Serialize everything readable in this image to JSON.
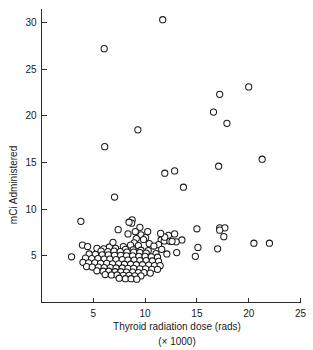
{
  "chart_data": {
    "type": "scatter",
    "title": "",
    "xlabel": "Thyroid radiation dose (rads)",
    "xlabel_sub": "(× 1000)",
    "ylabel": "mCi Administered",
    "xlim": [
      0,
      25
    ],
    "ylim": [
      0,
      31.5
    ],
    "xticks": [
      5,
      10,
      15,
      20,
      25
    ],
    "yticks": [
      5,
      10,
      15,
      20,
      25,
      30
    ],
    "xtick_labels": [
      "5",
      "10",
      "15",
      "20",
      "25"
    ],
    "ytick_labels": [
      "5",
      "10",
      "15",
      "20",
      "25",
      "30"
    ],
    "grid": false,
    "legend": null,
    "marker": "open-circle",
    "marker_color": "#1a1a1a",
    "marker_face": "#ffffff",
    "points": [
      [
        11.7,
        30.3
      ],
      [
        6.05,
        27.2
      ],
      [
        20.0,
        23.1
      ],
      [
        17.2,
        22.3
      ],
      [
        16.6,
        20.4
      ],
      [
        17.9,
        19.2
      ],
      [
        9.3,
        18.5
      ],
      [
        6.1,
        16.7
      ],
      [
        21.3,
        15.35
      ],
      [
        17.1,
        14.6
      ],
      [
        12.85,
        14.1
      ],
      [
        11.9,
        13.85
      ],
      [
        13.7,
        12.35
      ],
      [
        7.05,
        11.3
      ],
      [
        3.8,
        8.7
      ],
      [
        8.75,
        8.85
      ],
      [
        8.7,
        8.5
      ],
      [
        15.0,
        7.9
      ],
      [
        17.2,
        8.0
      ],
      [
        17.7,
        8.0
      ],
      [
        17.2,
        7.75
      ],
      [
        9.5,
        8.05
      ],
      [
        7.4,
        7.8
      ],
      [
        12.85,
        7.35
      ],
      [
        17.6,
        7.05
      ],
      [
        8.35,
        7.35
      ],
      [
        9.6,
        7.25
      ],
      [
        12.25,
        7.2
      ],
      [
        10.05,
        6.95
      ],
      [
        9.15,
        6.85
      ],
      [
        9.85,
        6.75
      ],
      [
        11.55,
        6.7
      ],
      [
        13.55,
        6.7
      ],
      [
        11.85,
        6.6
      ],
      [
        12.4,
        6.55
      ],
      [
        20.5,
        6.35
      ],
      [
        22.0,
        6.35
      ],
      [
        8.95,
        6.4
      ],
      [
        10.4,
        6.3
      ],
      [
        11.3,
        6.2
      ],
      [
        3.95,
        6.15
      ],
      [
        4.45,
        6.0
      ],
      [
        8.6,
        6.15
      ],
      [
        9.35,
        6.1
      ],
      [
        10.85,
        6.05
      ],
      [
        7.9,
        6.0
      ],
      [
        6.55,
        5.95
      ],
      [
        15.1,
        5.9
      ],
      [
        17.0,
        5.75
      ],
      [
        5.35,
        5.8
      ],
      [
        6.0,
        5.75
      ],
      [
        7.15,
        5.8
      ],
      [
        8.1,
        5.7
      ],
      [
        8.85,
        5.65
      ],
      [
        9.6,
        5.6
      ],
      [
        10.3,
        5.55
      ],
      [
        5.75,
        5.5
      ],
      [
        6.4,
        5.45
      ],
      [
        7.0,
        5.5
      ],
      [
        7.6,
        5.45
      ],
      [
        8.25,
        5.4
      ],
      [
        8.9,
        5.4
      ],
      [
        9.5,
        5.35
      ],
      [
        10.1,
        5.3
      ],
      [
        11.05,
        5.25
      ],
      [
        13.05,
        5.35
      ],
      [
        14.85,
        4.95
      ],
      [
        2.9,
        4.9
      ],
      [
        4.6,
        5.2
      ],
      [
        5.2,
        5.15
      ],
      [
        5.85,
        5.1
      ],
      [
        6.45,
        5.1
      ],
      [
        7.05,
        5.05
      ],
      [
        7.65,
        5.05
      ],
      [
        8.2,
        5.0
      ],
      [
        8.8,
        5.0
      ],
      [
        9.4,
        4.95
      ],
      [
        10.0,
        4.95
      ],
      [
        10.6,
        4.9
      ],
      [
        11.2,
        4.85
      ],
      [
        4.25,
        4.75
      ],
      [
        4.85,
        4.7
      ],
      [
        5.45,
        4.7
      ],
      [
        6.05,
        4.65
      ],
      [
        6.6,
        4.65
      ],
      [
        7.2,
        4.6
      ],
      [
        7.8,
        4.6
      ],
      [
        8.35,
        4.55
      ],
      [
        8.95,
        4.55
      ],
      [
        9.5,
        4.5
      ],
      [
        10.1,
        4.5
      ],
      [
        10.7,
        4.45
      ],
      [
        11.3,
        4.4
      ],
      [
        4.0,
        4.3
      ],
      [
        4.55,
        4.25
      ],
      [
        5.15,
        4.25
      ],
      [
        5.7,
        4.2
      ],
      [
        6.3,
        4.2
      ],
      [
        6.85,
        4.15
      ],
      [
        7.45,
        4.15
      ],
      [
        8.0,
        4.1
      ],
      [
        8.6,
        4.1
      ],
      [
        9.15,
        4.05
      ],
      [
        9.75,
        4.05
      ],
      [
        10.35,
        4.0
      ],
      [
        10.9,
        3.95
      ],
      [
        11.45,
        3.95
      ],
      [
        4.35,
        3.85
      ],
      [
        4.9,
        3.8
      ],
      [
        5.5,
        3.8
      ],
      [
        6.05,
        3.75
      ],
      [
        6.65,
        3.75
      ],
      [
        7.2,
        3.7
      ],
      [
        7.8,
        3.7
      ],
      [
        8.35,
        3.65
      ],
      [
        8.9,
        3.65
      ],
      [
        9.5,
        3.6
      ],
      [
        10.05,
        3.6
      ],
      [
        10.65,
        3.55
      ],
      [
        11.2,
        3.55
      ],
      [
        5.35,
        3.4
      ],
      [
        5.95,
        3.35
      ],
      [
        6.5,
        3.35
      ],
      [
        7.1,
        3.3
      ],
      [
        7.65,
        3.3
      ],
      [
        8.2,
        3.25
      ],
      [
        8.8,
        3.25
      ],
      [
        9.35,
        3.2
      ],
      [
        9.9,
        3.2
      ],
      [
        10.5,
        3.15
      ],
      [
        6.15,
        3.0
      ],
      [
        6.75,
        2.95
      ],
      [
        7.3,
        2.95
      ],
      [
        7.9,
        2.9
      ],
      [
        8.45,
        2.9
      ],
      [
        9.0,
        2.85
      ],
      [
        9.6,
        2.85
      ],
      [
        7.5,
        2.6
      ],
      [
        8.1,
        2.55
      ],
      [
        8.65,
        2.55
      ],
      [
        9.2,
        2.5
      ],
      [
        6.9,
        6.45
      ],
      [
        11.6,
        5.7
      ],
      [
        12.1,
        5.2
      ],
      [
        13.0,
        6.5
      ],
      [
        12.6,
        6.55
      ],
      [
        11.9,
        7.0
      ],
      [
        11.5,
        7.4
      ],
      [
        9.05,
        7.6
      ],
      [
        10.25,
        7.6
      ],
      [
        8.45,
        8.6
      ]
    ]
  }
}
